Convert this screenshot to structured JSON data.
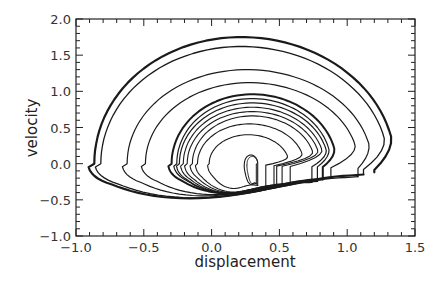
{
  "chart_data": {
    "type": "line",
    "title": "",
    "xlabel": "displacement",
    "ylabel": "velocity",
    "xlim": [
      -1.0,
      1.5
    ],
    "ylim": [
      -1.0,
      2.0
    ],
    "x_ticks": [
      -1.0,
      -0.5,
      0.0,
      0.5,
      1.0,
      1.5
    ],
    "x_tick_labels": [
      "−1.0",
      "−0.5",
      "0.0",
      "0.5",
      "1.0",
      "1.5"
    ],
    "y_ticks": [
      -1.0,
      -0.5,
      0.0,
      0.5,
      1.0,
      1.5,
      2.0
    ],
    "y_tick_labels": [
      "−1.0",
      "−0.5",
      "0.0",
      "0.5",
      "1.0",
      "1.5",
      "2.0"
    ],
    "x_minor_step": 0.1,
    "y_minor_step": 0.1,
    "grid": false,
    "legend": null,
    "series": [
      {
        "name": "trajectory",
        "loops": [
          {
            "cx": 0.22,
            "rx": 1.13,
            "ry_top": 1.75,
            "ry_bot": 0.75,
            "cusp_x": 1.2,
            "cusp_v": -0.12,
            "width": 2.2
          },
          {
            "cx": 0.22,
            "rx": 1.08,
            "ry_top": 1.62,
            "ry_bot": 0.72,
            "cusp_x": 1.12,
            "cusp_v": -0.15,
            "width": 1.3
          },
          {
            "cx": 0.26,
            "rx": 0.92,
            "ry_top": 1.3,
            "ry_bot": 0.66,
            "cusp_x": 1.08,
            "cusp_v": -0.18,
            "width": 1.2
          },
          {
            "cx": 0.28,
            "rx": 0.8,
            "ry_top": 1.12,
            "ry_bot": 0.62,
            "cusp_x": 0.88,
            "cusp_v": -0.2,
            "width": 1.2
          },
          {
            "cx": 0.3,
            "rx": 0.62,
            "ry_top": 0.96,
            "ry_bot": 0.58,
            "cusp_x": 0.82,
            "cusp_v": -0.22,
            "width": 2.0
          },
          {
            "cx": 0.3,
            "rx": 0.58,
            "ry_top": 0.9,
            "ry_bot": 0.56,
            "cusp_x": 0.78,
            "cusp_v": -0.24,
            "width": 1.2
          },
          {
            "cx": 0.3,
            "rx": 0.56,
            "ry_top": 0.84,
            "ry_bot": 0.54,
            "cusp_x": 0.74,
            "cusp_v": -0.26,
            "width": 1.2
          },
          {
            "cx": 0.3,
            "rx": 0.53,
            "ry_top": 0.78,
            "ry_bot": 0.52,
            "cusp_x": 0.58,
            "cusp_v": -0.28,
            "width": 1.1
          },
          {
            "cx": 0.3,
            "rx": 0.5,
            "ry_top": 0.72,
            "ry_bot": 0.5,
            "cusp_x": 0.52,
            "cusp_v": -0.3,
            "width": 1.1
          },
          {
            "cx": 0.3,
            "rx": 0.46,
            "ry_top": 0.66,
            "ry_bot": 0.48,
            "cusp_x": 0.48,
            "cusp_v": -0.32,
            "width": 1.1
          },
          {
            "cx": 0.28,
            "rx": 0.4,
            "ry_top": 0.55,
            "ry_bot": 0.44,
            "cusp_x": 0.46,
            "cusp_v": -0.34,
            "width": 1.1
          },
          {
            "cx": 0.27,
            "rx": 0.3,
            "ry_top": 0.4,
            "ry_bot": 0.4,
            "cusp_x": 0.4,
            "cusp_v": -0.36,
            "width": 1.1
          },
          {
            "cx": 0.29,
            "rx": 0.05,
            "ry_top": 0.12,
            "ry_bot": 0.3,
            "cusp_x": 0.34,
            "cusp_v": -0.3,
            "width": 1.1
          },
          {
            "cx": 0.3,
            "rx": 0.04,
            "ry_top": 0.1,
            "ry_bot": 0.28,
            "cusp_x": 0.33,
            "cusp_v": -0.28,
            "width": 1.0
          }
        ]
      }
    ]
  },
  "layout": {
    "plot_left": 76,
    "plot_right": 415,
    "plot_top": 19,
    "plot_bottom": 236
  }
}
